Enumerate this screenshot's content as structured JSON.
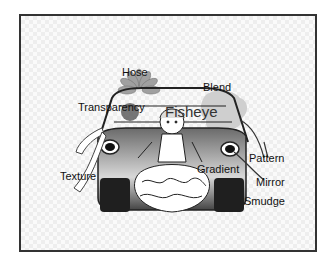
{
  "illustration": {
    "subject": "cartoon car with girl in frilly dress",
    "labels": [
      {
        "id": "hose",
        "text": "Hose",
        "x": 122,
        "y": 66
      },
      {
        "id": "blend",
        "text": "Blend",
        "x": 203,
        "y": 81
      },
      {
        "id": "transparency",
        "text": "Transparency",
        "x": 78,
        "y": 101
      },
      {
        "id": "fisheye",
        "text": "Fisheye",
        "x": 165,
        "y": 105
      },
      {
        "id": "texture",
        "text": "Texture",
        "x": 60,
        "y": 170
      },
      {
        "id": "gradient",
        "text": "Gradient",
        "x": 197,
        "y": 163
      },
      {
        "id": "pattern",
        "text": "Pattern",
        "x": 249,
        "y": 152
      },
      {
        "id": "mirror",
        "text": "Mirror",
        "x": 256,
        "y": 176
      },
      {
        "id": "smudge",
        "text": "Smudge",
        "x": 244,
        "y": 195
      }
    ]
  },
  "colors": {
    "frame_border": "#333333",
    "car_body_dark": "#3a3a3a",
    "car_body_mid": "#8a8a8a",
    "flower_petals": "#9a9a9a",
    "blend_cloud": "#cfcfcf"
  }
}
